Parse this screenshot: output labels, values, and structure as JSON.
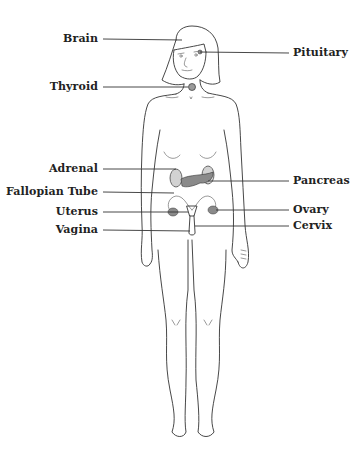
{
  "diagram": {
    "colors": {
      "outline": "#333333",
      "organ_dark": "#8a8a8a",
      "organ_light": "#d2d2d2",
      "text": "#222222"
    },
    "labels_left": [
      {
        "id": "brain",
        "text": "Brain",
        "y": 39
      },
      {
        "id": "thyroid",
        "text": "Thyroid",
        "y": 87
      },
      {
        "id": "adrenal",
        "text": "Adrenal",
        "y": 169
      },
      {
        "id": "fallopian-tube",
        "text": "Fallopian Tube",
        "y": 192
      },
      {
        "id": "uterus",
        "text": "Uterus",
        "y": 212
      },
      {
        "id": "vagina",
        "text": "Vagina",
        "y": 230
      }
    ],
    "labels_right": [
      {
        "id": "pituitary",
        "text": "Pituitary",
        "y": 53
      },
      {
        "id": "pancreas",
        "text": "Pancreas",
        "y": 181
      },
      {
        "id": "ovary",
        "text": "Ovary",
        "y": 210
      },
      {
        "id": "cervix",
        "text": "Cervix",
        "y": 226
      }
    ]
  }
}
